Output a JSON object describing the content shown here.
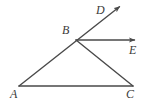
{
  "figure": {
    "name": "angle-ray-diagram",
    "background_color": "#ffffff",
    "stroke_color": "#4a4a4a",
    "label_color": "#3a3a3a",
    "stroke_width": 1.4,
    "labels": {
      "a": "A",
      "b": "B",
      "c": "C",
      "d": "D",
      "e": "E"
    },
    "points": {
      "A": {
        "x": 19,
        "y": 86
      },
      "B": {
        "x": 76,
        "y": 40
      },
      "C": {
        "x": 133,
        "y": 86
      },
      "D_tip": {
        "x": 123,
        "y": 4
      },
      "E_tip": {
        "x": 139,
        "y": 40
      }
    },
    "segments": [
      {
        "name": "ray-A-through-B-to-D",
        "from": "A",
        "to": "D_tip",
        "arrow_at_end": true
      },
      {
        "name": "ray-B-to-E",
        "from": "B",
        "to": "E_tip",
        "arrow_at_end": true
      },
      {
        "name": "segment-B-to-C",
        "from": "B",
        "to": "C",
        "arrow_at_end": false
      },
      {
        "name": "segment-A-to-C",
        "from": "A",
        "to": "C",
        "arrow_at_end": false
      }
    ]
  }
}
